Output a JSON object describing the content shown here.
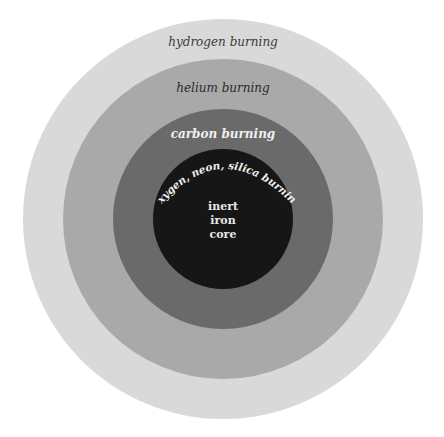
{
  "diagram": {
    "center": {
      "x": 223,
      "y": 219
    },
    "layers": [
      {
        "name": "hydrogen-shell",
        "label": "hydrogen burning",
        "radius": 200,
        "color": "#d9d9d9",
        "text_color": "#3a3a3a"
      },
      {
        "name": "helium-shell",
        "label": "helium burning",
        "radius": 160,
        "color": "#a9a9a9",
        "text_color": "#2a2a2a"
      },
      {
        "name": "carbon-shell",
        "label": "carbon burning",
        "radius": 110,
        "color": "#6a6a6a",
        "text_color": "#f0f0f0"
      },
      {
        "name": "oxygen-neon-silica-shell",
        "label": "oxygen, neon, silica burning",
        "radius": 70,
        "color": "#161616",
        "text_color": "#f0f0f0"
      }
    ],
    "core": {
      "line1": "inert",
      "line2": "iron",
      "line3": "core",
      "text_color": "#e8e8e8"
    }
  }
}
